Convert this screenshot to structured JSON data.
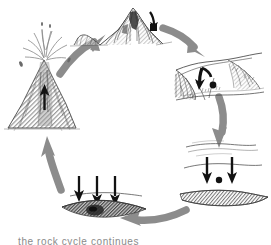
{
  "diagram": {
    "title": "Rock Cycle",
    "background_color": "#ffffff",
    "ink_color": "#2b2b2b",
    "arrow_color": "#8c8c8c",
    "shading_color": "#a0a0a0",
    "flow_direction": "clockwise",
    "stage_count": 5
  },
  "stages": [
    {
      "id": "mountain-uplift",
      "label": "mountain",
      "description": "Jagged snow-capped mountain peak with rocky ridge; small black arrow on right slope indicating weathering and rock fall",
      "position": "top-center",
      "marker": "black-arrow-down-right"
    },
    {
      "id": "eroded-hills",
      "label": "eroded hills",
      "description": "Low eroded hills and river valley; black curved arrow and black dot showing sediment being transported downslope",
      "position": "right-upper",
      "marker": "black-curved-arrow-and-dot"
    },
    {
      "id": "deposition-water",
      "label": "deposition",
      "description": "Water surface with two black downward arrows and a black dot, sediment settling onto a cross-hatched bed below",
      "position": "right-lower",
      "marker": "two-down-arrows-and-dot"
    },
    {
      "id": "burial-compaction",
      "label": "burial",
      "description": "Three black downward arrows pressing onto a dark cross-hatched sediment lens; compaction and burial",
      "position": "bottom-left",
      "marker": "three-down-arrows"
    },
    {
      "id": "volcano-eruption",
      "label": "volcano",
      "description": "Erupting volcano with spraying ejecta plume and a black upward arrow inside the vent showing rising magma",
      "position": "left",
      "marker": "black-arrow-up"
    }
  ],
  "flow_arrows": [
    {
      "id": "arrow-volcano-to-mountain",
      "from": "volcano-eruption",
      "to": "mountain-uplift",
      "direction": "up-right"
    },
    {
      "id": "arrow-mountain-to-hills",
      "from": "mountain-uplift",
      "to": "eroded-hills",
      "direction": "down-right"
    },
    {
      "id": "arrow-hills-to-deposition",
      "from": "eroded-hills",
      "to": "deposition-water",
      "direction": "down"
    },
    {
      "id": "arrow-deposition-to-burial",
      "from": "deposition-water",
      "to": "burial-compaction",
      "direction": "left"
    },
    {
      "id": "arrow-burial-to-volcano",
      "from": "burial-compaction",
      "to": "volcano-eruption",
      "direction": "up"
    }
  ],
  "caption": {
    "text": "the rock cycle continues",
    "visible": "clipped at bottom edge"
  }
}
